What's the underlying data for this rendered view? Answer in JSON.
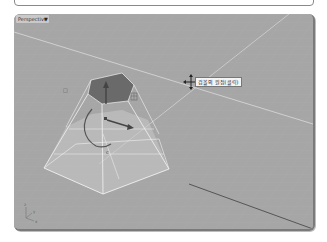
{
  "command_bar": {
    "value": ""
  },
  "viewport": {
    "name": "Perspective",
    "menu_icon": "caret-down-icon",
    "background_color": "#a6a6a6",
    "grid_color": "#b4b4b4",
    "object": {
      "type": "truncated-pyramid",
      "selected": true,
      "top_face_color": "#6a6a6a",
      "edge_color": "#ffffff"
    },
    "gumball": {
      "axes": [
        "z-arrow",
        "x-arrow",
        "rotation-arc",
        "scale-handle"
      ]
    },
    "cursor": {
      "icon": "move-cursor-icon"
    },
    "tooltip": "검볼의 원점(클릭)",
    "axis_indicator": {
      "labels": [
        "z",
        "y",
        "x"
      ]
    }
  }
}
